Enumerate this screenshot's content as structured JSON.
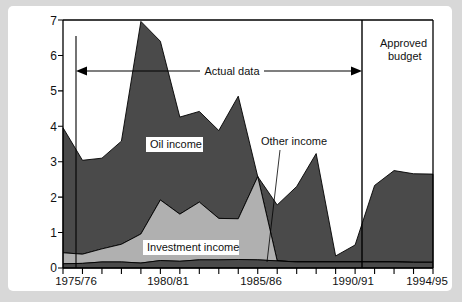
{
  "chart_data": {
    "type": "area",
    "title": "",
    "subtitle": "",
    "xlabel": "",
    "ylabel": "",
    "stacked": true,
    "grid": false,
    "legend_position": "inline-labels",
    "ylim": [
      0,
      7
    ],
    "y_ticks": [
      0,
      1,
      2,
      3,
      4,
      5,
      6,
      7
    ],
    "x_tick_labels": [
      "1975/76",
      "1980/81",
      "1985/86",
      "1990/91",
      "1994/95"
    ],
    "x_tick_label_indices": [
      0,
      5,
      10,
      15,
      19
    ],
    "x": [
      "1975/76",
      "1976/77",
      "1977/78",
      "1978/79",
      "1979/80",
      "1980/81",
      "1981/82",
      "1982/83",
      "1983/84",
      "1984/85",
      "1985/86",
      "1986/87",
      "1987/88",
      "1988/89",
      "1989/90",
      "1990/91",
      "1991/92",
      "1992/93",
      "1993/94",
      "1994/95"
    ],
    "series": [
      {
        "name": "Other income",
        "color": "#4a4a4a",
        "values": [
          0.12,
          0.13,
          0.17,
          0.17,
          0.14,
          0.21,
          0.19,
          0.23,
          0.23,
          0.24,
          0.23,
          0.2,
          0.17,
          0.17,
          0.17,
          0.17,
          0.17,
          0.17,
          0.16,
          0.16
        ]
      },
      {
        "name": "Investment income",
        "color": "#b0b0b0",
        "values": [
          0.31,
          0.26,
          0.37,
          0.5,
          0.82,
          1.71,
          1.33,
          1.63,
          1.17,
          1.15,
          2.35,
          0,
          0,
          0,
          0,
          0,
          0,
          0,
          0,
          0
        ]
      },
      {
        "name": "Oil income",
        "color": "#4a4a4a",
        "values": [
          3.53,
          2.65,
          2.56,
          2.91,
          6.0,
          4.48,
          2.74,
          2.56,
          2.48,
          3.46,
          0,
          1.58,
          2.13,
          3.06,
          0.17,
          0.48,
          2.16,
          2.58,
          2.5,
          2.49
        ]
      }
    ],
    "stack_top_values": [
      3.96,
      3.04,
      3.1,
      3.58,
      6.96,
      6.4,
      4.26,
      4.42,
      3.88,
      4.85,
      2.58,
      1.78,
      2.3,
      3.23,
      0.34,
      0.65,
      2.33,
      2.75,
      2.66,
      2.65
    ],
    "annotations": [
      {
        "name": "actual-data",
        "text": "Actual data",
        "type": "double-arrow",
        "from_x": "1975/76",
        "to_x": "1992/93",
        "y": 5.55
      },
      {
        "name": "approved-budget",
        "text": "Approved budget",
        "type": "vertical-marker",
        "at_x": "1992/93"
      },
      {
        "name": "other-income-callout",
        "text": "Other income",
        "type": "leader-line",
        "target_x": "1986/87",
        "target_y": 0.2
      }
    ],
    "series_labels": [
      {
        "name": "oil-income-label",
        "text": "Oil income"
      },
      {
        "name": "investment-income-label",
        "text": "Investment income"
      }
    ]
  },
  "annotations": {
    "actual_data": "Actual data",
    "approved_budget_line1": "Approved",
    "approved_budget_line2": "budget",
    "other_income": "Other income",
    "oil_income": "Oil income",
    "investment_income": "Investment income"
  },
  "y_ticks": {
    "t0": "0",
    "t1": "1",
    "t2": "2",
    "t3": "3",
    "t4": "4",
    "t5": "5",
    "t6": "6",
    "t7": "7"
  },
  "x_ticks": {
    "t0": "1975/76",
    "t1": "1980/81",
    "t2": "1985/86",
    "t3": "1990/91",
    "t4": "1994/95"
  },
  "colors": {
    "dark_series": "#4a4a4a",
    "light_series": "#b0b0b0",
    "axis": "#000000",
    "page_background": "#d8d8d8",
    "card_background": "#ffffff"
  }
}
